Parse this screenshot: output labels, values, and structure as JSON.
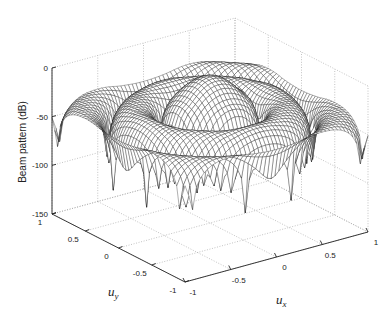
{
  "chart_data": {
    "type": "surface",
    "title": "",
    "xlabel": "u_x",
    "ylabel": "u_y",
    "zlabel": "Beam pattern (dB)",
    "xlim": [
      -1,
      1
    ],
    "ylim": [
      -1,
      1
    ],
    "zlim": [
      -150,
      0
    ],
    "xticks": [
      -1,
      -0.5,
      0,
      0.5,
      1
    ],
    "yticks": [
      -1,
      -0.5,
      0,
      0.5,
      1
    ],
    "zticks": [
      -150,
      -100,
      -50,
      0
    ],
    "xtick_labels": [
      "-1",
      "-0.5",
      "0",
      "0.5",
      "1"
    ],
    "ytick_labels": [
      "-1",
      "-0.5",
      "0",
      "0.5",
      "1"
    ],
    "ztick_labels": [
      "-150",
      "-100",
      "-50",
      "0"
    ],
    "grid": true,
    "peak": {
      "ux": 0,
      "uy": 0,
      "value_db": 0
    },
    "floor_db": -150,
    "mesh_color": "#1a1a1a",
    "grid_color": "#9a9a9a"
  },
  "labels": {
    "zlabel": "Beam pattern (dB)",
    "xlabel_main": "u",
    "xlabel_sub": "x",
    "ylabel_main": "u",
    "ylabel_sub": "y"
  }
}
